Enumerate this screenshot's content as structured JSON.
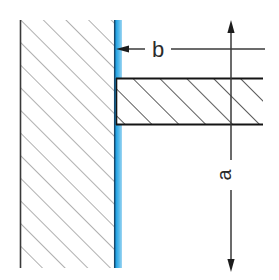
{
  "diagram": {
    "canvas": {
      "width": 279,
      "height": 280,
      "background": "#ffffff"
    },
    "colors": {
      "background": "#ffffff",
      "wall_hatch": "#6e6e6e",
      "wall_outline": "#3a3a3a",
      "beam_hatch": "#2a2a2a",
      "beam_outline": "#151515",
      "membrane_blue": "#1f9ee0",
      "membrane_blue_light": "#7cc8ee",
      "membrane_blue_dark": "#0f7dbd",
      "dimension_line": "#3a3a3a",
      "label_text": "#2b2b2b"
    },
    "elements": {
      "wall": {
        "name": "wall-section",
        "hatch_angle_deg": 45,
        "hatch_spacing_px": 16,
        "bounds": {
          "x": 20,
          "y": 20,
          "width": 95,
          "height": 248
        }
      },
      "membrane": {
        "name": "blue-membrane-layer",
        "bounds": {
          "x": 115,
          "y": 20,
          "width": 7,
          "height": 248
        },
        "color": "#1f9ee0"
      },
      "beam": {
        "name": "beam-section",
        "hatch_angle_deg": 45,
        "hatch_spacing_px": 19,
        "bounds": {
          "x": 116,
          "y": 78,
          "width": 147,
          "height": 47
        }
      }
    },
    "annotations": {
      "thickness_label": {
        "name": "dimension-label-b",
        "text": "b",
        "meaning": "membrane thickness",
        "leader_y": 49,
        "arrow_target_x": 122,
        "leader_left_start_x": 145,
        "leader_right_end_x": 265
      },
      "vertical_label": {
        "name": "dimension-label-a",
        "text": "a",
        "meaning": "vertical distance",
        "rotated_deg": -90,
        "x": 231,
        "y": 174
      },
      "vertical_dimension_line": {
        "name": "vertical-dimension-line",
        "x": 231,
        "top_arrow_y": 20,
        "bottom_arrow_y": 272
      }
    }
  }
}
